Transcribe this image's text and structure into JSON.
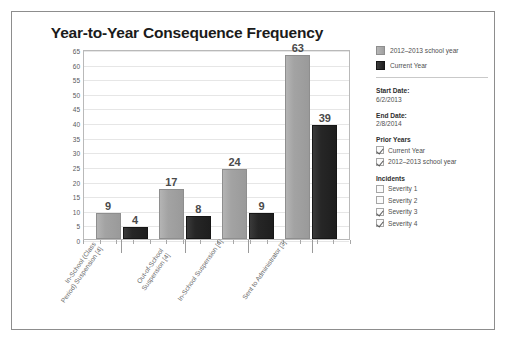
{
  "chart_data": {
    "type": "bar",
    "title": "Year-to-Year Consequence Frequency",
    "xlabel": "",
    "ylabel": "",
    "ylim": [
      0,
      65
    ],
    "yticks": [
      65,
      60,
      55,
      50,
      45,
      40,
      35,
      30,
      25,
      20,
      15,
      10,
      5,
      0
    ],
    "grid": true,
    "legend_position": "right",
    "categories": [
      "In-School (Class Period) Suspension [4]",
      "Out-of-School Suspension [4]",
      "In-School Suspension [4]",
      "Sent to Administrator [3]"
    ],
    "series": [
      {
        "name": "2012–2013 school year",
        "color": "#a3a3a3",
        "values": [
          9,
          17,
          24,
          63
        ]
      },
      {
        "name": "Current Year",
        "color": "#262626",
        "values": [
          4,
          8,
          9,
          39
        ]
      }
    ]
  },
  "sidebar": {
    "legend": [
      {
        "label": "2012–2013 school year",
        "swatch": "prior"
      },
      {
        "label": "Current Year",
        "swatch": "current"
      }
    ],
    "start_date": {
      "label": "Start Date:",
      "value": "6/2/2013"
    },
    "end_date": {
      "label": "End Date:",
      "value": "2/8/2014"
    },
    "prior_years": {
      "heading": "Prior Years",
      "options": [
        {
          "label": "Current Year",
          "checked": true
        },
        {
          "label": "2012–2013 school year",
          "checked": true
        }
      ]
    },
    "incidents": {
      "heading": "Incidents",
      "options": [
        {
          "label": "Severity 1",
          "checked": false
        },
        {
          "label": "Severity 2",
          "checked": false
        },
        {
          "label": "Severity 3",
          "checked": true
        },
        {
          "label": "Severity 4",
          "checked": true
        }
      ]
    }
  }
}
